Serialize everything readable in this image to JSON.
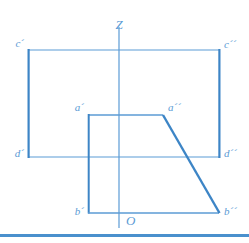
{
  "figure": {
    "title_visible": false,
    "axis": {
      "vertical_label": "Z",
      "origin_label": "O"
    },
    "labels": {
      "c_prime": "c´",
      "c_double_prime": "c´´",
      "d_prime": "d´",
      "d_double_prime": "d´´",
      "a_prime": "a´",
      "a_double_prime": "a´´",
      "b_prime": "b´",
      "b_double_prime": "b´´"
    },
    "colors": {
      "line": "#5b9bd5",
      "line_strong": "#3d85c6",
      "rule": "#4a90cd",
      "background": "#ffffff"
    },
    "geometry": {
      "outer_rect": {
        "x1": 28,
        "y1": 50,
        "x2": 220,
        "y2": 157
      },
      "inner_rect": {
        "x1": 88,
        "y1": 115,
        "x2": 163,
        "y2": 213
      },
      "axis_line": {
        "x": 119,
        "y1": 27,
        "y2": 228
      },
      "diagonal": {
        "x1": 163,
        "y1": 115,
        "x2": 219,
        "y2": 213
      },
      "bottom_base": {
        "x1": 88,
        "y1": 213,
        "x2": 219,
        "y2": 213
      },
      "rule_y": 234
    }
  }
}
